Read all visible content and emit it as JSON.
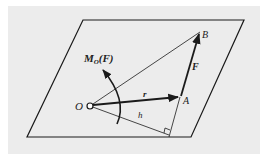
{
  "figure": {
    "labels": {
      "moment_main": "M",
      "moment_sub": "O",
      "moment_arg": "(F)",
      "point_O": "O",
      "point_A": "A",
      "point_B": "B",
      "force": "F",
      "position": "r",
      "arm": "h"
    },
    "colors": {
      "background_panel": "#ececec",
      "line": "#1a1a1a"
    }
  }
}
